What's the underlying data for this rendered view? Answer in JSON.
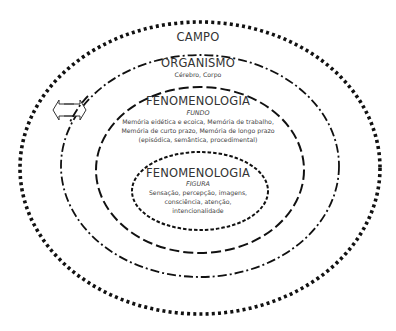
{
  "diagram": {
    "type": "nested-ellipses",
    "layers": [
      {
        "id": "campo",
        "title": "CAMPO",
        "subtitle": "",
        "detail_lines": [],
        "border_style": "dotted",
        "border_color": "#111111"
      },
      {
        "id": "organismo",
        "title": "ORGANISMO",
        "subtitle": "Cérebro, Corpo",
        "detail_lines": [],
        "border_style": "dash-dot",
        "border_color": "#111111"
      },
      {
        "id": "fenomenologia-fundo",
        "title": "FENOMENOLOGIA",
        "subtitle": "FUNDO",
        "detail_lines": [
          "Memória eidética e ecoica, Memória de trabalho,",
          "Memória de curto prazo, Memória de longo prazo",
          "(episódica, semântica, procedimental)"
        ],
        "border_style": "dashed",
        "border_color": "#111111"
      },
      {
        "id": "fenomenologia-figura",
        "title": "FENOMENOLOGIA",
        "subtitle": "FIGURA",
        "detail_lines": [
          "Sensação, percepção, imagens,",
          "consciência, atenção,",
          "intencionalidade"
        ],
        "border_style": "short-dashed",
        "border_color": "#111111"
      }
    ],
    "connector": {
      "icon": "left-right-arrow-icon",
      "description": "double-headed horizontal outline arrow crossing the ORGANISMO boundary"
    }
  }
}
